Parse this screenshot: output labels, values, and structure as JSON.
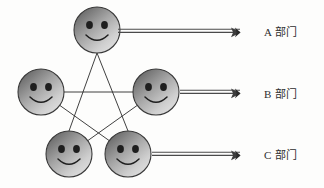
{
  "diagram": {
    "title": "",
    "type": "network-pentagram",
    "background_color": "#fdfdfc",
    "nodes": [
      {
        "id": "n1",
        "name": "smiley-face-top",
        "icon": "smiley-face-icon",
        "cx": 97,
        "cy": 30,
        "r": 23
      },
      {
        "id": "n2",
        "name": "smiley-face-middle-left",
        "icon": "smiley-face-icon",
        "cx": 41,
        "cy": 92,
        "r": 23
      },
      {
        "id": "n3",
        "name": "smiley-face-middle-right",
        "icon": "smiley-face-icon",
        "cx": 156,
        "cy": 92,
        "r": 23
      },
      {
        "id": "n4",
        "name": "smiley-face-bottom-left",
        "icon": "smiley-face-icon",
        "cx": 69,
        "cy": 154,
        "r": 23
      },
      {
        "id": "n5",
        "name": "smiley-face-bottom-right",
        "icon": "smiley-face-icon",
        "cx": 128,
        "cy": 154,
        "r": 23
      }
    ],
    "edges": [
      {
        "from": "n1",
        "to": "n4"
      },
      {
        "from": "n4",
        "to": "n3"
      },
      {
        "from": "n3",
        "to": "n2"
      },
      {
        "from": "n2",
        "to": "n5"
      },
      {
        "from": "n5",
        "to": "n1"
      }
    ],
    "face_colors": {
      "gradient_dark": "#6b6b6b",
      "gradient_light": "#d8d8d8",
      "outline": "#3a3a3a",
      "eye": "#222222",
      "mouth": "#222222"
    },
    "edge_color": "#2b2b2b",
    "arrow_color": "#4a4a4a"
  },
  "arrows": [
    {
      "name": "arrow-to-a",
      "x1": 118,
      "x2": 245,
      "y": 31,
      "label_key": 0
    },
    {
      "name": "arrow-to-b",
      "x1": 178,
      "x2": 245,
      "y": 92,
      "label_key": 1
    },
    {
      "name": "arrow-to-c",
      "x1": 150,
      "x2": 245,
      "y": 154,
      "label_key": 2
    }
  ],
  "labels": [
    {
      "name": "label-department-a",
      "text": "A 部门",
      "x": 264,
      "y": 24
    },
    {
      "name": "label-department-b",
      "text": "B 部门",
      "x": 264,
      "y": 85
    },
    {
      "name": "label-department-c",
      "text": "C 部门",
      "x": 264,
      "y": 147
    }
  ],
  "background_artifacts": [
    {
      "text": "",
      "x": 8,
      "y": 6
    },
    {
      "text": "",
      "x": 150,
      "y": 6
    },
    {
      "text": "",
      "x": 8,
      "y": 46
    },
    {
      "text": "",
      "x": 260,
      "y": 170
    }
  ]
}
